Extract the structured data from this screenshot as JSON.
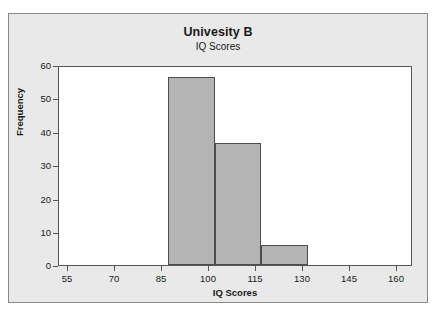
{
  "chart_data": {
    "type": "bar",
    "title": "Univesity B",
    "subtitle": "IQ Scores",
    "xlabel": "IQ Scores",
    "ylabel": "Frequency",
    "xlim": [
      50,
      163
    ],
    "ylim": [
      0,
      60
    ],
    "grid": false,
    "legend": false,
    "bar_fill_color": "#b4b4b4",
    "bar_edge_color": "#4d4d4d",
    "plot_background": "#ffffff",
    "panel_background": "#e9e9e9",
    "xticks": [
      55,
      70,
      85,
      100,
      115,
      130,
      145,
      160
    ],
    "yticks": [
      0,
      10,
      20,
      30,
      40,
      50,
      60
    ],
    "bins": [
      {
        "start": 85,
        "end": 100,
        "frequency": 57
      },
      {
        "start": 100,
        "end": 115,
        "frequency": 37
      },
      {
        "start": 115,
        "end": 130,
        "frequency": 6
      }
    ],
    "categories": [
      "85-100",
      "100-115",
      "115-130"
    ],
    "values": [
      57,
      37,
      6
    ]
  }
}
